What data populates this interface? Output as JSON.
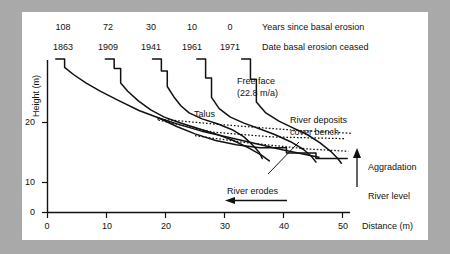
{
  "figure": {
    "header_rows": [
      {
        "id": "years-row",
        "label": "Years since basal erosion",
        "values": [
          "108",
          "72",
          "30",
          "10",
          "0"
        ]
      },
      {
        "id": "dates-row",
        "label": "Date basal erosion ceased",
        "values": [
          "1863",
          "1909",
          "1941",
          "1961",
          "1971"
        ]
      }
    ],
    "axes": {
      "y_label": "Height (m)",
      "y_ticks": [
        "0",
        "10",
        "20"
      ],
      "x_label": "Distance (m)",
      "x_ticks": [
        "0",
        "10",
        "20",
        "30",
        "40",
        "50"
      ]
    },
    "annotations": {
      "free_face": "Free face",
      "free_face_rate": "(22.8 m/a)",
      "talus": "Talus",
      "river_deposits_l1": "River deposits",
      "river_deposits_l2": "cover bench",
      "aggradation": "Aggradation",
      "river_level": "River level",
      "river_erodes": "River erodes"
    },
    "colors": {
      "page_background": "#a9a9a9",
      "panel_background": "#ffffff",
      "ink": "#111111"
    }
  },
  "chart_data": {
    "type": "line",
    "title": "",
    "xlabel": "Distance (m)",
    "ylabel": "Height (m)",
    "xlim": [
      0,
      55
    ],
    "ylim": [
      0,
      27
    ],
    "grid": false,
    "legend": "none",
    "series": [
      {
        "name": "Profile 1863 (108 years)",
        "years_since_basal_erosion": 108,
        "date_basal_erosion_ceased": 1863,
        "points": [
          [
            1.4,
            25.6
          ],
          [
            2.9,
            25.6
          ],
          [
            2.9,
            24.2
          ],
          [
            4.4,
            23.0
          ],
          [
            6.5,
            21.6
          ],
          [
            9.0,
            20.2
          ],
          [
            12.0,
            18.7
          ],
          [
            15.5,
            17.0
          ],
          [
            19.0,
            15.7
          ],
          [
            22.5,
            14.6
          ],
          [
            26.0,
            13.6
          ],
          [
            29.5,
            12.8
          ],
          [
            33.0,
            12.0
          ],
          [
            36.5,
            11.2
          ],
          [
            40.0,
            10.4
          ],
          [
            43.5,
            9.7
          ],
          [
            46.0,
            9.2
          ]
        ]
      },
      {
        "name": "Profile 1909 (72 years)",
        "years_since_basal_erosion": 72,
        "date_basal_erosion_ceased": 1909,
        "points": [
          [
            9.8,
            25.6
          ],
          [
            11.3,
            25.6
          ],
          [
            11.3,
            24.0
          ],
          [
            12.4,
            24.0
          ],
          [
            12.4,
            21.6
          ],
          [
            13.6,
            20.2
          ],
          [
            15.4,
            18.6
          ],
          [
            17.5,
            17.1
          ],
          [
            19.8,
            15.9
          ],
          [
            22.3,
            15.0
          ],
          [
            25.5,
            14.0
          ],
          [
            28.5,
            13.1
          ],
          [
            31.5,
            12.0
          ],
          [
            34.0,
            10.8
          ],
          [
            36.2,
            9.6
          ],
          [
            37.6,
            8.6
          ]
        ]
      },
      {
        "name": "Profile 1941 (30 years)",
        "years_since_basal_erosion": 30,
        "date_basal_erosion_ceased": 1941,
        "points": [
          [
            17.8,
            25.6
          ],
          [
            19.3,
            25.6
          ],
          [
            19.3,
            23.6
          ],
          [
            20.3,
            23.6
          ],
          [
            20.3,
            21.0
          ],
          [
            21.4,
            19.3
          ],
          [
            22.6,
            17.8
          ],
          [
            24.0,
            16.6
          ],
          [
            26.2,
            15.6
          ],
          [
            28.8,
            14.8
          ],
          [
            31.3,
            13.8
          ],
          [
            33.3,
            12.6
          ],
          [
            34.8,
            11.2
          ],
          [
            35.9,
            10.0
          ],
          [
            36.4,
            9.0
          ]
        ]
      },
      {
        "name": "Profile 1961 (10 years)",
        "years_since_basal_erosion": 10,
        "date_basal_erosion_ceased": 1961,
        "points": [
          [
            25.3,
            25.6
          ],
          [
            26.8,
            25.6
          ],
          [
            26.8,
            22.4
          ],
          [
            27.8,
            22.4
          ],
          [
            27.8,
            19.2
          ],
          [
            29.1,
            17.3
          ],
          [
            31.0,
            15.9
          ],
          [
            33.3,
            14.9
          ],
          [
            35.8,
            14.0
          ],
          [
            38.5,
            13.0
          ],
          [
            41.2,
            11.8
          ],
          [
            43.4,
            10.5
          ],
          [
            44.8,
            9.3
          ],
          [
            45.5,
            8.4
          ]
        ]
      },
      {
        "name": "Profile 1971 (0 years)",
        "years_since_basal_erosion": 0,
        "date_basal_erosion_ceased": 1971,
        "points": [
          [
            32.9,
            25.6
          ],
          [
            34.4,
            25.6
          ],
          [
            34.4,
            22.2
          ],
          [
            35.4,
            22.2
          ],
          [
            35.4,
            18.4
          ],
          [
            37.0,
            16.6
          ],
          [
            39.3,
            15.2
          ],
          [
            41.6,
            14.1
          ],
          [
            44.0,
            13.0
          ],
          [
            46.2,
            11.6
          ],
          [
            48.0,
            10.2
          ],
          [
            49.2,
            9.0
          ],
          [
            49.8,
            8.2
          ]
        ]
      },
      {
        "name": "Bench / valley floor (lower solid)",
        "points": [
          [
            18.8,
            15.8
          ],
          [
            22.0,
            14.3
          ],
          [
            25.0,
            13.1
          ],
          [
            28.5,
            12.0
          ],
          [
            32.0,
            11.3
          ],
          [
            36.0,
            10.8
          ],
          [
            40.5,
            10.8
          ],
          [
            40.5,
            9.9
          ],
          [
            45.5,
            9.9
          ],
          [
            45.5,
            9.0
          ],
          [
            50.8,
            9.0
          ]
        ]
      }
    ],
    "dotted_lines": [
      {
        "name": "aggradation-surface-upper",
        "points": [
          [
            18.6,
            15.6
          ],
          [
            30.0,
            14.6
          ],
          [
            42.0,
            13.7
          ],
          [
            51.5,
            13.2
          ]
        ]
      },
      {
        "name": "aggradation-surface-middle",
        "points": [
          [
            18.8,
            15.4
          ],
          [
            28.0,
            13.4
          ],
          [
            38.0,
            12.6
          ],
          [
            50.5,
            12.3
          ]
        ]
      },
      {
        "name": "aggradation-surface-lower",
        "points": [
          [
            25.0,
            12.8
          ],
          [
            34.0,
            11.6
          ],
          [
            44.0,
            10.6
          ],
          [
            51.0,
            10.2
          ]
        ]
      }
    ],
    "arrows": [
      {
        "name": "river-erodes-arrow",
        "direction": "left",
        "from": [
          40.5,
          3.6
        ],
        "to": [
          28.5,
          3.6
        ]
      },
      {
        "name": "aggradation-arrow",
        "direction": "up",
        "from": [
          52.5,
          8.4
        ],
        "to": [
          52.5,
          14.8
        ]
      }
    ]
  }
}
